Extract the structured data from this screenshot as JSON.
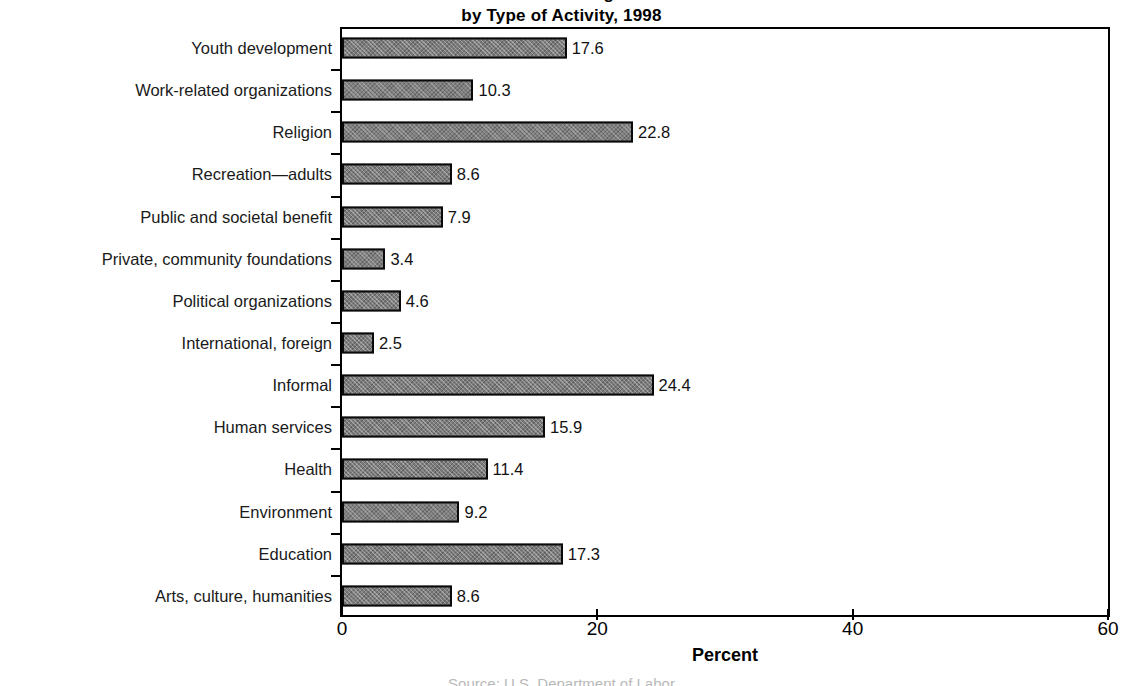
{
  "chart_data": {
    "type": "bar",
    "orientation": "horizontal",
    "title": "Volunteering by Type of Activity, 1998",
    "title_line1": "Volunteering",
    "title_line2": "by Type of Activity, 1998",
    "xlabel": "Percent",
    "ylabel": "",
    "xlim": [
      0,
      60
    ],
    "xticks": [
      0,
      20,
      40,
      60
    ],
    "xtick_labels": [
      "0",
      "20",
      "40",
      "60"
    ],
    "grid": false,
    "legend": null,
    "bar_color": "#7c7c7c",
    "bar_edge_color": "#0a0a0a",
    "source_note": "Source: U.S. Department of Labor",
    "categories": [
      "Youth development",
      "Work-related organizations",
      "Religion",
      "Recreation—adults",
      "Public and societal benefit",
      "Private, community foundations",
      "Political organizations",
      "International, foreign",
      "Informal",
      "Human services",
      "Health",
      "Environment",
      "Education",
      "Arts, culture, humanities"
    ],
    "values": [
      17.6,
      10.3,
      22.8,
      8.6,
      7.9,
      3.4,
      4.6,
      2.5,
      24.4,
      15.9,
      11.4,
      9.2,
      17.3,
      8.6
    ],
    "value_labels": [
      "17.6",
      "10.3",
      "22.8",
      "8.6",
      "7.9",
      "3.4",
      "4.6",
      "2.5",
      "24.4",
      "15.9",
      "11.4",
      "9.2",
      "17.3",
      "8.6"
    ]
  }
}
